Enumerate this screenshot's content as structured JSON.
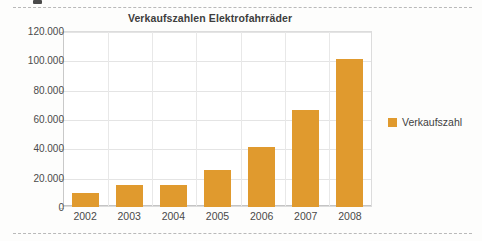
{
  "page": {
    "divider_top_name": "dashed-rule-top",
    "divider_bottom_name": "dashed-rule-bottom"
  },
  "chart_data": {
    "type": "bar",
    "title": "Verkaufszahlen Elektrofahrräder",
    "xlabel": "",
    "ylabel": "",
    "categories": [
      "2002",
      "2003",
      "2004",
      "2005",
      "2006",
      "2007",
      "2008"
    ],
    "values": [
      9500,
      15000,
      15000,
      25500,
      41000,
      66000,
      101000
    ],
    "series": [
      {
        "name": "Verkaufszahl",
        "color": "#E09A2E",
        "values": [
          9500,
          15000,
          15000,
          25500,
          41000,
          66000,
          101000
        ]
      }
    ],
    "ylim": [
      0,
      120000
    ],
    "ytick_values": [
      0,
      20000,
      40000,
      60000,
      80000,
      100000,
      120000
    ],
    "ytick_labels": [
      "0",
      "20.000",
      "40.000",
      "60.000",
      "80.000",
      "100.000",
      "120.000"
    ],
    "grid": true,
    "grid_axis": "both",
    "legend": {
      "position": "right",
      "entries": [
        {
          "label": "Verkaufszahl",
          "color": "#E09A2E"
        }
      ]
    }
  }
}
